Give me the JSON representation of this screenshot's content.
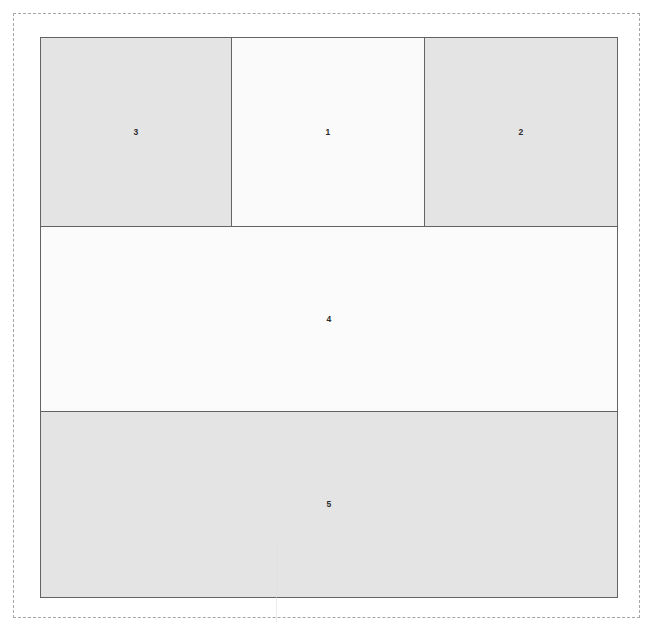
{
  "diagram": {
    "boundary": {
      "name": "page-boundary",
      "style": "dashed",
      "color": "#a6a6a6"
    },
    "palette": {
      "region_border": "#636363",
      "label_text": "#2b2b2b",
      "fill_shaded": "#e4e4e4",
      "fill_light": "#fafafa",
      "boundary_dash": "#a6a6a6",
      "page_background": "#ffffff"
    },
    "regions": [
      {
        "id": "1",
        "label": "1",
        "fill": "#fafafa",
        "tone": "light",
        "row": 1,
        "column": 2
      },
      {
        "id": "2",
        "label": "2",
        "fill": "#e4e4e4",
        "tone": "shaded",
        "row": 1,
        "column": 3
      },
      {
        "id": "3",
        "label": "3",
        "fill": "#e4e4e4",
        "tone": "shaded",
        "row": 1,
        "column": 1
      },
      {
        "id": "4",
        "label": "4",
        "fill": "#fbfbfb",
        "tone": "light",
        "row": 2,
        "column": 1
      },
      {
        "id": "5",
        "label": "5",
        "fill": "#e4e4e4",
        "tone": "shaded",
        "row": 3,
        "column": 1
      }
    ]
  }
}
